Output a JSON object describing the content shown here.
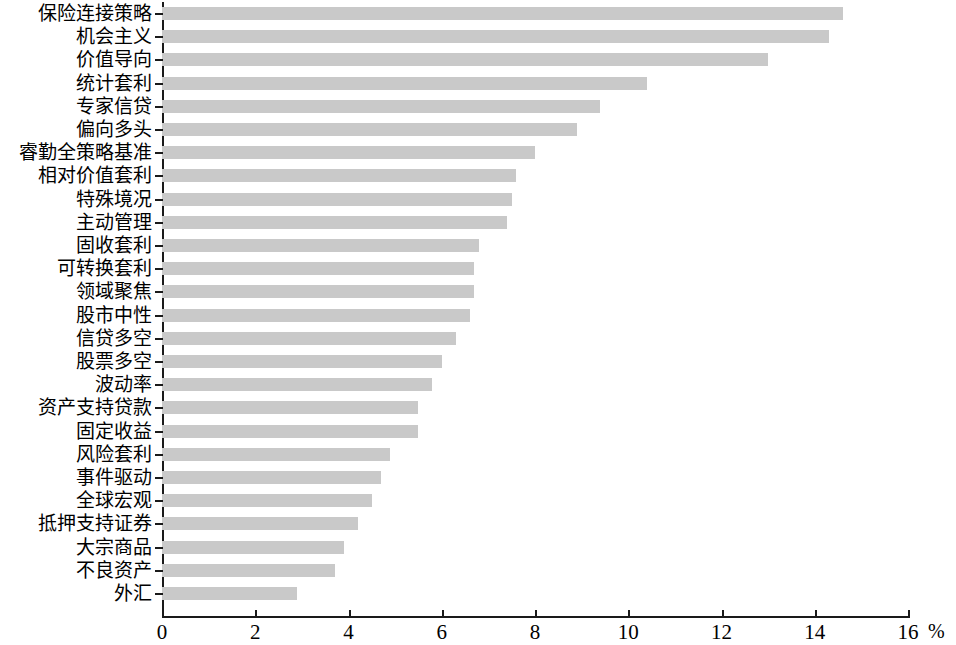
{
  "chart_data": {
    "type": "bar",
    "orientation": "horizontal",
    "title": "",
    "subtitle": "",
    "xlabel": "%",
    "ylabel": "",
    "xlim": [
      0,
      16
    ],
    "xticks": [
      0,
      2,
      4,
      6,
      8,
      10,
      12,
      14,
      16
    ],
    "xtick_labels": [
      "0",
      "2",
      "4",
      "6",
      "8",
      "10",
      "12",
      "14",
      "16"
    ],
    "grid": false,
    "legend": null,
    "bar_color": "#c9c9c9",
    "axis_color": "#1a1a1a",
    "categories": [
      "保险连接策略",
      "机会主义",
      "价值导向",
      "统计套利",
      "专家信贷",
      "偏向多头",
      "睿勤全策略基准",
      "相对价值套利",
      "特殊境况",
      "主动管理",
      "固收套利",
      "可转换套利",
      "领域聚焦",
      "股市中性",
      "信贷多空",
      "股票多空",
      "波动率",
      "资产支持贷款",
      "固定收益",
      "风险套利",
      "事件驱动",
      "全球宏观",
      "抵押支持证券",
      "大宗商品",
      "不良资产",
      "外汇"
    ],
    "values": [
      14.6,
      14.3,
      13.0,
      10.4,
      9.4,
      8.9,
      8.0,
      7.6,
      7.5,
      7.4,
      6.8,
      6.7,
      6.7,
      6.6,
      6.3,
      6.0,
      5.8,
      5.5,
      5.5,
      4.9,
      4.7,
      4.5,
      4.2,
      3.9,
      3.7,
      2.9
    ]
  }
}
